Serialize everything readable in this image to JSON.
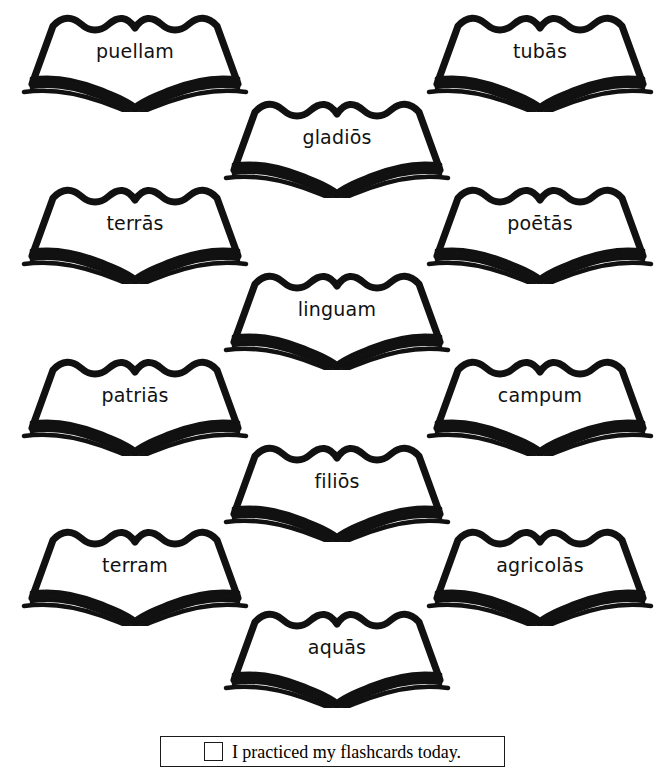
{
  "page": {
    "background_color": "#ffffff",
    "ink_color": "#111111",
    "width": 669,
    "height": 781
  },
  "cards": [
    {
      "word": "puellam",
      "column": "left",
      "row": 1,
      "x": 10,
      "y": 12
    },
    {
      "word": "tubās",
      "column": "right",
      "row": 1,
      "x": 415,
      "y": 12
    },
    {
      "word": "gladiōs",
      "column": "center",
      "row": 1,
      "x": 212,
      "y": 98
    },
    {
      "word": "terrās",
      "column": "left",
      "row": 2,
      "x": 10,
      "y": 184
    },
    {
      "word": "poētās",
      "column": "right",
      "row": 2,
      "x": 415,
      "y": 184
    },
    {
      "word": "linguam",
      "column": "center",
      "row": 2,
      "x": 212,
      "y": 270
    },
    {
      "word": "patriās",
      "column": "left",
      "row": 3,
      "x": 10,
      "y": 356
    },
    {
      "word": "campum",
      "column": "right",
      "row": 3,
      "x": 415,
      "y": 356
    },
    {
      "word": "filiōs",
      "column": "center",
      "row": 3,
      "x": 212,
      "y": 442
    },
    {
      "word": "terram",
      "column": "left",
      "row": 4,
      "x": 10,
      "y": 526
    },
    {
      "word": "agricolās",
      "column": "right",
      "row": 4,
      "x": 415,
      "y": 526
    },
    {
      "word": "aquās",
      "column": "center",
      "row": 4,
      "x": 212,
      "y": 608
    }
  ],
  "footer": {
    "checkbox_checked": false,
    "label": "I practiced my flashcards today."
  }
}
